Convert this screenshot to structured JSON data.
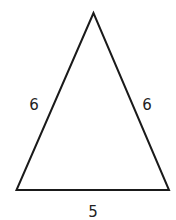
{
  "diagram": {
    "shape": "isosceles triangle",
    "sides": {
      "left": "6",
      "right": "6",
      "base": "5"
    },
    "stroke_color": "#1a1a1a",
    "label_color": "#222222"
  }
}
